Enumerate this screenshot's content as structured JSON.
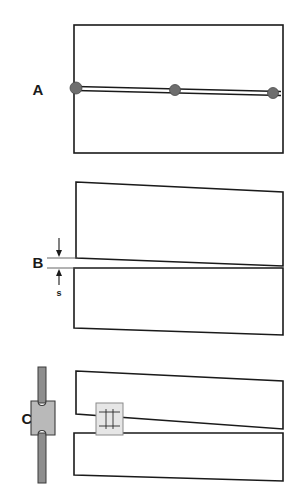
{
  "figure": {
    "title": "",
    "background_color": "#ffffff",
    "line_color": "#1a1a1a",
    "marker_color": "#6e6e6e",
    "gauge_color": "#b9b9b9",
    "width": 306,
    "height": 496
  },
  "panels": [
    {
      "id": "A",
      "letter": "A",
      "letter_x": 38,
      "letter_y": 95,
      "description": "intact-specimen-with-crack",
      "specimen": {
        "x": 74,
        "y": 25,
        "width": 209,
        "height": 128
      },
      "crack": {
        "y_left": 88,
        "y_right": 93,
        "separation": 3
      },
      "markers": [
        {
          "name": "marker-left",
          "cx": 76,
          "cy": 88,
          "r": 6
        },
        {
          "name": "marker-middle",
          "cx": 175,
          "cy": 90,
          "r": 5.5
        },
        {
          "name": "marker-right",
          "cx": 273,
          "cy": 93,
          "r": 5.5
        }
      ]
    },
    {
      "id": "B",
      "letter": "B",
      "letter_x": 38,
      "letter_y": 268,
      "description": "separated-halves-with-gap-dimension",
      "dimension": {
        "label": "s",
        "label_x": 59,
        "label_y": 296,
        "arrow_top_y": 238,
        "arrow_tip_top_y": 256,
        "arrow_bottom_y": 285,
        "arrow_tip_bottom_y": 268,
        "arrow_x": 59
      },
      "upper_half": {
        "points": "76,182 283,192 283,266 76,258"
      },
      "lower_half": {
        "points": "74,268 283,268 283,335 74,328"
      }
    },
    {
      "id": "C",
      "letter": "C",
      "letter_x": 27,
      "letter_y": 424,
      "description": "specimen-with-clip-gauge-attached",
      "clip_gauge": {
        "arm_x": 38,
        "arm_top_y": 367,
        "arm_bottom_y": 483,
        "arm_width": 8,
        "body_x": 31,
        "body_y": 401,
        "body_width": 24,
        "body_height": 34
      },
      "gauge_block": {
        "x": 96,
        "y": 403,
        "width": 27,
        "height": 32
      },
      "upper_half": {
        "points": "76,371 283,381 283,429 76,414"
      },
      "lower_half": {
        "points": "74,433 283,433 283,481 74,475"
      }
    }
  ],
  "annotations": {
    "gap_dimension_symbol": "s",
    "panel_letters": [
      "A",
      "B",
      "C"
    ]
  }
}
